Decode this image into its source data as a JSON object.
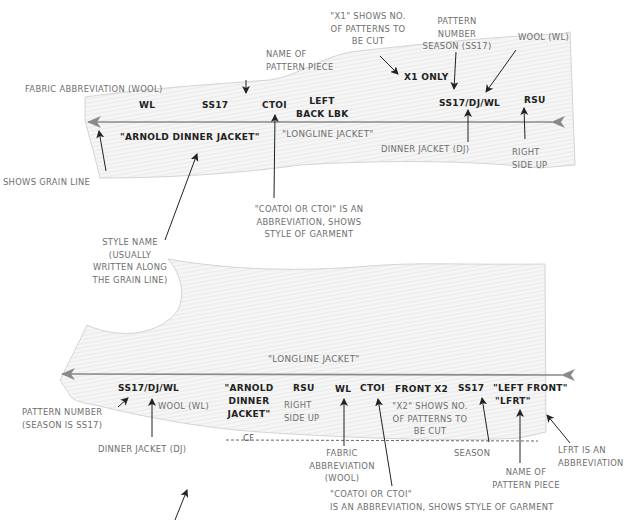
{
  "colors": {
    "piece_fill": "#f3f3f3",
    "piece_outline": "#d4d4d4",
    "grain_line": "#8a8a8a",
    "marking_text": "#222222",
    "annotation_text": "#6e6e6e",
    "annotation_arrow": "#222222"
  },
  "top_piece": {
    "name": "left-back-pattern-piece",
    "markings": {
      "fabric": "WL",
      "season": "SS17",
      "style_code": "CTOI",
      "piece_name_line1": "LEFT",
      "piece_name_line2": "BACK LBK",
      "cut_quantity": "X1 ONLY",
      "pattern_number": "SS17/DJ/WL",
      "orientation": "RSU",
      "style_name": "\"ARNOLD DINNER JACKET\"",
      "longline": "\"LONGLINE JACKET\""
    },
    "annotations": {
      "fabric_abbreviation": "FABRIC ABBREVIATION (WOOL)",
      "name_of_piece": [
        "NAME OF",
        "PATTERN PIECE"
      ],
      "x1_shows": [
        "\"X1\" SHOWS NO.",
        "OF PATTERNS TO",
        "BE CUT"
      ],
      "pattern_number_season": [
        "PATTERN",
        "NUMBER",
        "SEASON (SS17)"
      ],
      "wool": "WOOL (WL)",
      "dinner_jacket": "DINNER JACKET (DJ)",
      "right_side_up": [
        "RIGHT",
        "SIDE UP"
      ],
      "shows_grain_line": "SHOWS GRAIN LINE",
      "coatoi": [
        "\"COATOI OR CTOI\" IS AN",
        "ABBREVIATION, SHOWS",
        "STYLE OF GARMENT"
      ],
      "style_name": [
        "STYLE NAME",
        "(USUALLY",
        "WRITTEN ALONG",
        "THE GRAIN LINE)"
      ]
    }
  },
  "bottom_piece": {
    "name": "left-front-pattern-piece",
    "markings": {
      "longline": "\"LONGLINE JACKET\"",
      "pattern_number": "SS17/DJ/WL",
      "style_name": [
        "\"ARNOLD",
        "DINNER",
        "JACKET\""
      ],
      "orientation": "RSU",
      "fabric": "WL",
      "style_code": "CTOI",
      "cut_quantity": "FRONT X2",
      "season": "SS17",
      "piece_name": "\"LEFT FRONT\"",
      "piece_abbrev": "\"LFRT\"",
      "centre_front": "CF"
    },
    "annotations": {
      "pattern_number": [
        "PATTERN NUMBER",
        "(SEASON IS SS17)"
      ],
      "wool": "WOOL (WL)",
      "dinner_jacket": "DINNER JACKET (DJ)",
      "right_side_up": [
        "RIGHT",
        "SIDE UP"
      ],
      "x2_shows": [
        "\"X2\" SHOWS NO.",
        "OF PATTERNS TO",
        "BE CUT"
      ],
      "fabric_abbreviation": [
        "FABRIC",
        "ABBREVIATION",
        "(WOOL)"
      ],
      "season": "SEASON",
      "name_of_piece": [
        "NAME OF",
        "PATTERN PIECE"
      ],
      "lfrt_abbreviation": [
        "LFRT IS AN",
        "ABBREVIATION"
      ],
      "coatoi": [
        "\"COATOI OR CTOI\"",
        "IS AN ABBREVIATION, SHOWS STYLE OF GARMENT"
      ]
    }
  }
}
